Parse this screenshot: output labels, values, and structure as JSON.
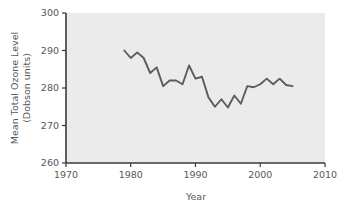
{
  "chart_data": {
    "type": "line",
    "title": "",
    "xlabel": "Year",
    "ylabel": "Mean Total Ozone Level (Dobson units)",
    "ylabel_line1": "Mean Total Ozone Level",
    "ylabel_line2": "(Dobson units)",
    "xlim": [
      1970,
      2010
    ],
    "ylim": [
      260,
      300
    ],
    "xticks": [
      1970,
      1980,
      1990,
      2000,
      2010
    ],
    "xtick_labels": [
      "1970",
      "1980",
      "1990",
      "2000",
      "2010"
    ],
    "yticks": [
      260,
      270,
      280,
      290,
      300
    ],
    "ytick_labels": [
      "260",
      "270",
      "280",
      "290",
      "300"
    ],
    "grid": false,
    "legend": "none",
    "line_color": "#5b5c5e",
    "plot_background": "#ebebeb",
    "axis_color": "#3a3a3a",
    "series": [
      {
        "name": "Mean Total Ozone Level",
        "x": [
          1979,
          1980,
          1981,
          1982,
          1983,
          1984,
          1985,
          1986,
          1987,
          1988,
          1989,
          1990,
          1991,
          1992,
          1993,
          1994,
          1995,
          1996,
          1997,
          1998,
          1999,
          2000,
          2001,
          2002,
          2003,
          2004,
          2005
        ],
        "values": [
          290.0,
          288.0,
          289.5,
          288.0,
          284.0,
          285.5,
          280.5,
          282.0,
          282.0,
          281.0,
          286.0,
          282.5,
          283.0,
          277.5,
          275.0,
          277.0,
          274.8,
          278.0,
          275.8,
          280.5,
          280.2,
          281.0,
          282.5,
          281.0,
          282.5,
          280.8,
          280.5
        ]
      }
    ]
  }
}
